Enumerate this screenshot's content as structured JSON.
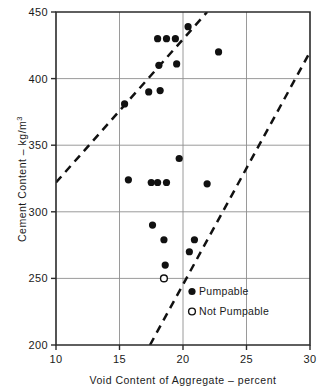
{
  "chart_data": {
    "type": "scatter",
    "title": "",
    "xlabel": "Void Content of Aggregate – percent",
    "ylabel": "Cement Content – kg/m",
    "ylabel_exponent": "3",
    "xlim": [
      10,
      30
    ],
    "ylim": [
      200,
      450
    ],
    "xticks": [
      10,
      15,
      20,
      25,
      30
    ],
    "yticks": [
      200,
      250,
      300,
      350,
      400,
      450
    ],
    "xtick_labels": [
      "10",
      "15",
      "20",
      "25",
      "30"
    ],
    "ytick_labels": [
      "200",
      "250",
      "300",
      "350",
      "400",
      "450"
    ],
    "grid": true,
    "legend_position": "inside-lower-right",
    "series": [
      {
        "name": "Pumpable",
        "marker": "filled-circle",
        "color": "#111111",
        "points": [
          {
            "x": 15.4,
            "y": 381
          },
          {
            "x": 15.7,
            "y": 324
          },
          {
            "x": 17.3,
            "y": 390
          },
          {
            "x": 17.5,
            "y": 322
          },
          {
            "x": 17.6,
            "y": 290
          },
          {
            "x": 18.0,
            "y": 430
          },
          {
            "x": 18.0,
            "y": 322
          },
          {
            "x": 18.1,
            "y": 410
          },
          {
            "x": 18.2,
            "y": 391
          },
          {
            "x": 18.5,
            "y": 279
          },
          {
            "x": 18.6,
            "y": 260
          },
          {
            "x": 18.7,
            "y": 430
          },
          {
            "x": 18.7,
            "y": 322
          },
          {
            "x": 19.4,
            "y": 430
          },
          {
            "x": 19.5,
            "y": 411
          },
          {
            "x": 19.7,
            "y": 340
          },
          {
            "x": 20.4,
            "y": 439
          },
          {
            "x": 20.5,
            "y": 270
          },
          {
            "x": 20.9,
            "y": 279
          },
          {
            "x": 21.9,
            "y": 321
          },
          {
            "x": 22.8,
            "y": 420
          }
        ]
      },
      {
        "name": "Not Pumpable",
        "marker": "open-circle",
        "color": "#111111",
        "points": [
          {
            "x": 18.5,
            "y": 250
          }
        ]
      }
    ],
    "annotations": [
      {
        "name": "upper-boundary-line",
        "style": "dashed",
        "x1": 10.0,
        "y1": 322,
        "x2": 21.9,
        "y2": 450
      },
      {
        "name": "lower-boundary-line",
        "style": "dashed",
        "x1": 17.4,
        "y1": 200,
        "x2": 30.0,
        "y2": 420
      }
    ]
  },
  "legend": {
    "items": [
      {
        "label": "Pumpable",
        "marker": "filled-circle"
      },
      {
        "label": "Not Pumpable",
        "marker": "open-circle"
      }
    ]
  }
}
